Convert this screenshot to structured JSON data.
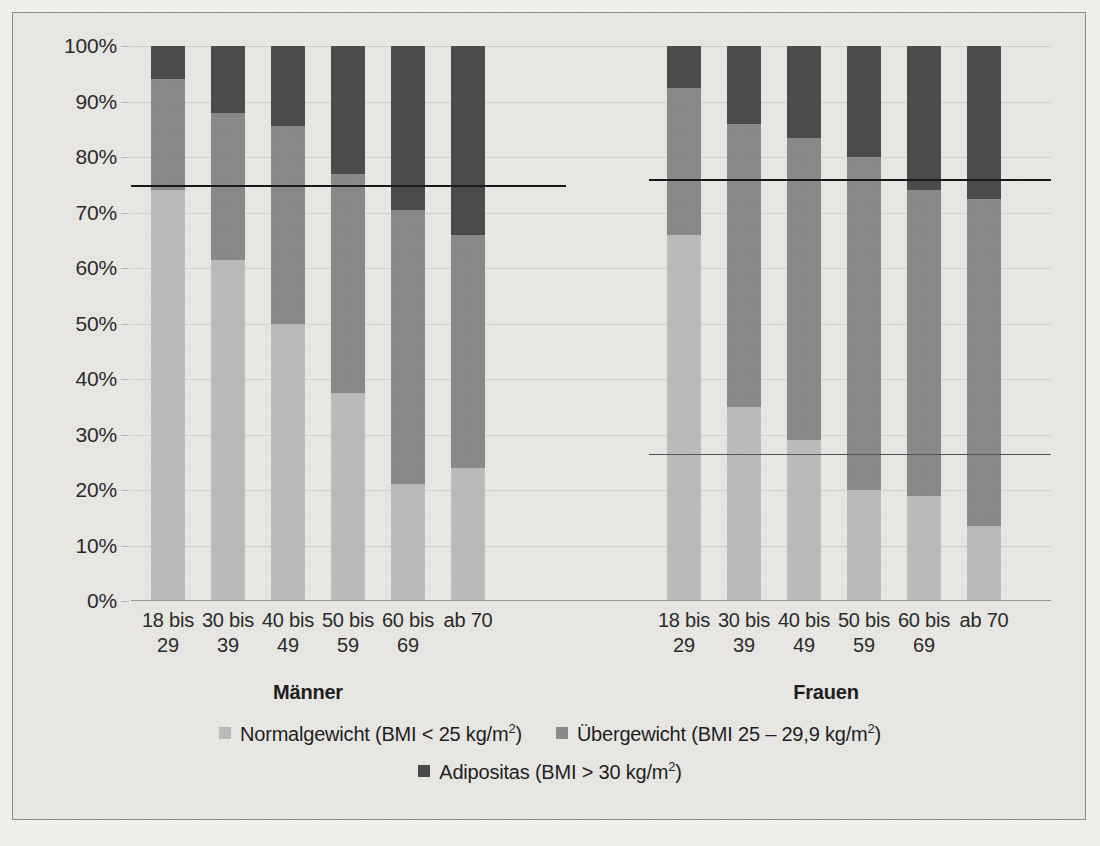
{
  "chart_data": {
    "type": "bar",
    "subtype": "stacked-100-percent",
    "title": "",
    "xlabel": "",
    "ylabel": "",
    "ylim": [
      0,
      100
    ],
    "ytick_labels": [
      "100%",
      "90%",
      "80%",
      "70%",
      "60%",
      "50%",
      "40%",
      "30%",
      "20%",
      "10%",
      "0%"
    ],
    "ytick_values": [
      100,
      90,
      80,
      70,
      60,
      50,
      40,
      30,
      20,
      10,
      0
    ],
    "grid": true,
    "legend_position": "bottom",
    "group_labels": [
      "Männer",
      "Frauen"
    ],
    "categories": [
      "18 bis 29",
      "30 bis 39",
      "40 bis 49",
      "50 bis 59",
      "60 bis 69",
      "ab 70"
    ],
    "series": [
      {
        "name": "Normalgewicht (BMI < 25 kg/m²)",
        "color": "#bcbcbc",
        "values_maenner": [
          74,
          61.5,
          50,
          37.5,
          21,
          24
        ],
        "values_frauen": [
          66,
          35,
          29,
          20,
          19,
          13.5
        ]
      },
      {
        "name": "Übergewicht (BMI 25 – 29,9 kg/m²)",
        "color": "#8a8a8a",
        "values_maenner": [
          20,
          26.5,
          35.5,
          39.5,
          49.5,
          42
        ],
        "values_frauen": [
          26.5,
          51,
          54.5,
          60,
          55,
          59
        ]
      },
      {
        "name": "Adipositas (BMI > 30 kg/m²)",
        "color": "#4c4c4c",
        "values_maenner": [
          6,
          12,
          14.5,
          23,
          29.5,
          34
        ],
        "values_frauen": [
          7.5,
          14,
          16.5,
          20,
          26,
          27.5
        ]
      }
    ],
    "reference_lines": [
      {
        "group": "Männer",
        "value": 75,
        "style": "thick"
      },
      {
        "group": "Frauen",
        "value": 76,
        "style": "thick"
      },
      {
        "group": "Frauen",
        "value": 26.5,
        "style": "thin"
      }
    ]
  },
  "yaxis": {
    "ticks": [
      {
        "label": "100%",
        "value": 100
      },
      {
        "label": "90%",
        "value": 90
      },
      {
        "label": "80%",
        "value": 80
      },
      {
        "label": "70%",
        "value": 70
      },
      {
        "label": "60%",
        "value": 60
      },
      {
        "label": "50%",
        "value": 50
      },
      {
        "label": "40%",
        "value": 40
      },
      {
        "label": "30%",
        "value": 30
      },
      {
        "label": "20%",
        "value": 20
      },
      {
        "label": "10%",
        "value": 10
      },
      {
        "label": "0%",
        "value": 0
      }
    ]
  },
  "xaxis": {
    "maenner": [
      {
        "line1": "18 bis",
        "line2": "29"
      },
      {
        "line1": "30 bis",
        "line2": "39"
      },
      {
        "line1": "40 bis",
        "line2": "49"
      },
      {
        "line1": "50 bis",
        "line2": "59"
      },
      {
        "line1": "60 bis",
        "line2": "69"
      },
      {
        "line1": "ab 70",
        "line2": ""
      }
    ],
    "frauen": [
      {
        "line1": "18 bis",
        "line2": "29"
      },
      {
        "line1": "30 bis",
        "line2": "39"
      },
      {
        "line1": "40 bis",
        "line2": "49"
      },
      {
        "line1": "50 bis",
        "line2": "59"
      },
      {
        "line1": "60 bis",
        "line2": "69"
      },
      {
        "line1": "ab 70",
        "line2": ""
      }
    ]
  },
  "groups": {
    "maenner_label": "Männer",
    "frauen_label": "Frauen"
  },
  "legend": {
    "normalgewicht": "Normalgewicht (BMI < 25 kg/m",
    "normalgewicht_sup": "2",
    "normalgewicht_tail": ")",
    "uebergewicht": "Übergewicht (BMI 25 – 29,9 kg/m",
    "uebergewicht_sup": "2",
    "uebergewicht_tail": ")",
    "adipositas": "Adipositas (BMI > 30 kg/m",
    "adipositas_sup": "2",
    "adipositas_tail": ")"
  },
  "colors": {
    "normalgewicht": "#bcbcbc",
    "uebergewicht": "#8a8a8a",
    "adipositas": "#4c4c4c",
    "background": "#e9e8e4",
    "reference_line": "#1a1a1a"
  }
}
